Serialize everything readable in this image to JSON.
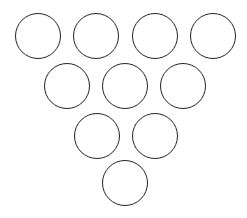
{
  "diagram": {
    "title": "",
    "stroke_color": "#222222",
    "fill_color": "#ffffff",
    "stroke_width": 1.6,
    "diameter": 46,
    "rows": [
      {
        "count": 4,
        "cy": 36,
        "cx": [
          38,
          96,
          155,
          213
        ]
      },
      {
        "count": 3,
        "cy": 86,
        "cx": [
          67,
          125,
          183
        ]
      },
      {
        "count": 2,
        "cy": 136,
        "cx": [
          97,
          155
        ]
      },
      {
        "count": 1,
        "cy": 183,
        "cx": [
          125
        ]
      }
    ]
  }
}
